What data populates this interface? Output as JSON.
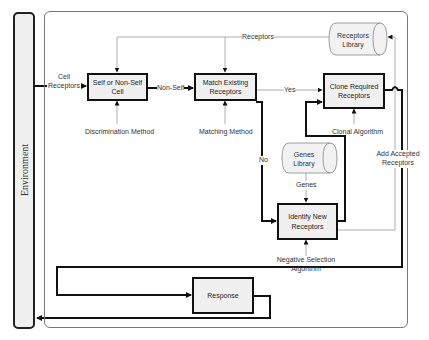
{
  "environment": {
    "label": "Environment"
  },
  "boxes": {
    "self_nonself": "Self or Non-Self Cell",
    "match_existing": "Match Existing Receptors",
    "clone_required": "Clone Required Receptors",
    "identify_new": "Identify New Receptors",
    "response": "Response"
  },
  "libraries": {
    "receptors": "Receptors Library",
    "genes": "Genes Library"
  },
  "labels": {
    "cell_receptors": "Cell Receptors",
    "non_self": "Non-Self",
    "yes": "Yes",
    "no": "No",
    "receptors": "Receptors",
    "genes": "Genes",
    "discrimination_method": "Discrimination Method",
    "matching_method": "Matching Method",
    "clonal_algorithm": "Clonal Algorithm",
    "negative_selection": "Negative Selection Algorithm",
    "add_accepted_receptors": "Add Accepted Receptors"
  },
  "colors": {
    "thick_line": "#111111",
    "thin_line": "#999999",
    "box_fill": "#f0f0f0",
    "library_fill": "#f2f2f2"
  }
}
